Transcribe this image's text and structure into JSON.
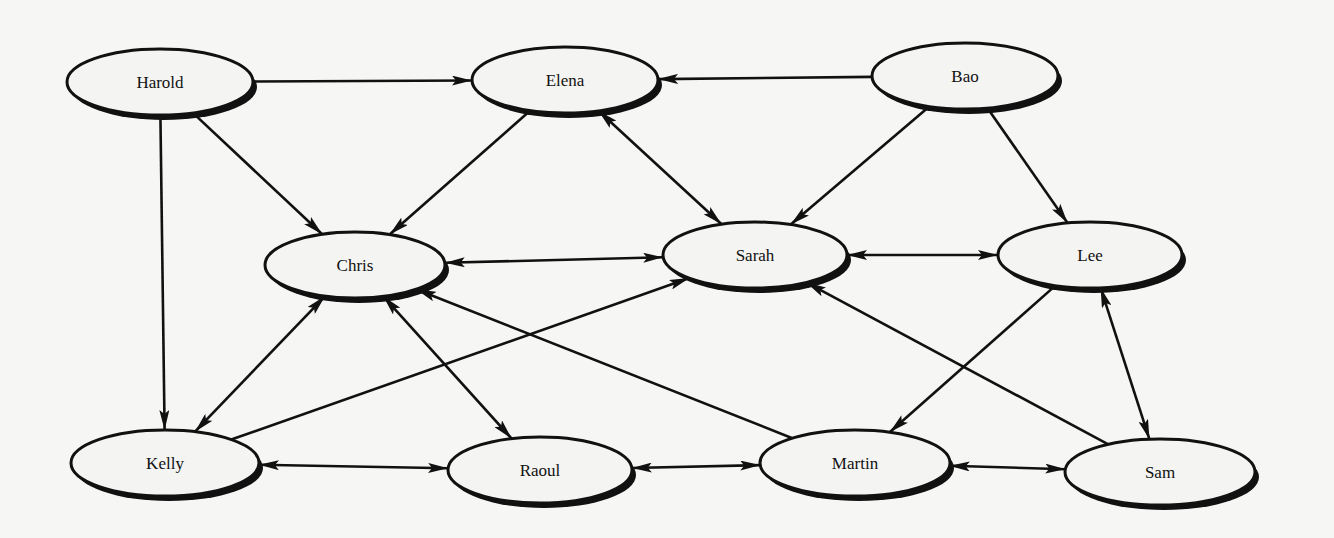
{
  "diagram": {
    "type": "directed-graph",
    "colors": {
      "background": "#f6f6f4",
      "node_fill": "#f4f4f2",
      "stroke": "#111111",
      "shadow": "#111111"
    },
    "nodes": [
      {
        "id": "harold",
        "label": "Harold",
        "cx": 160,
        "cy": 82,
        "rx": 93,
        "ry": 33
      },
      {
        "id": "elena",
        "label": "Elena",
        "cx": 565,
        "cy": 80,
        "rx": 93,
        "ry": 33
      },
      {
        "id": "bao",
        "label": "Bao",
        "cx": 965,
        "cy": 76,
        "rx": 93,
        "ry": 33
      },
      {
        "id": "chris",
        "label": "Chris",
        "cx": 355,
        "cy": 265,
        "rx": 90,
        "ry": 33
      },
      {
        "id": "sarah",
        "label": "Sarah",
        "cx": 755,
        "cy": 255,
        "rx": 92,
        "ry": 33
      },
      {
        "id": "lee",
        "label": "Lee",
        "cx": 1090,
        "cy": 255,
        "rx": 92,
        "ry": 33
      },
      {
        "id": "kelly",
        "label": "Kelly",
        "cx": 165,
        "cy": 463,
        "rx": 94,
        "ry": 33
      },
      {
        "id": "raoul",
        "label": "Raoul",
        "cx": 540,
        "cy": 470,
        "rx": 92,
        "ry": 33
      },
      {
        "id": "martin",
        "label": "Martin",
        "cx": 855,
        "cy": 463,
        "rx": 95,
        "ry": 33
      },
      {
        "id": "sam",
        "label": "Sam",
        "cx": 1160,
        "cy": 472,
        "rx": 95,
        "ry": 33
      }
    ],
    "edges": [
      {
        "from": "harold",
        "to": "elena",
        "bidirectional": false
      },
      {
        "from": "harold",
        "to": "chris",
        "bidirectional": false
      },
      {
        "from": "harold",
        "to": "kelly",
        "bidirectional": false
      },
      {
        "from": "bao",
        "to": "elena",
        "bidirectional": false
      },
      {
        "from": "bao",
        "to": "sarah",
        "bidirectional": false
      },
      {
        "from": "bao",
        "to": "lee",
        "bidirectional": false
      },
      {
        "from": "elena",
        "to": "chris",
        "bidirectional": false
      },
      {
        "from": "elena",
        "to": "sarah",
        "bidirectional": true
      },
      {
        "from": "chris",
        "to": "sarah",
        "bidirectional": true
      },
      {
        "from": "sarah",
        "to": "lee",
        "bidirectional": true
      },
      {
        "from": "chris",
        "to": "kelly",
        "bidirectional": true
      },
      {
        "from": "chris",
        "to": "raoul",
        "bidirectional": true
      },
      {
        "from": "kelly",
        "to": "sarah",
        "bidirectional": false
      },
      {
        "from": "martin",
        "to": "chris",
        "bidirectional": false
      },
      {
        "from": "sam",
        "to": "sarah",
        "bidirectional": false
      },
      {
        "from": "lee",
        "to": "martin",
        "bidirectional": false
      },
      {
        "from": "lee",
        "to": "sam",
        "bidirectional": true
      },
      {
        "from": "kelly",
        "to": "raoul",
        "bidirectional": true
      },
      {
        "from": "raoul",
        "to": "martin",
        "bidirectional": true
      },
      {
        "from": "martin",
        "to": "sam",
        "bidirectional": true
      }
    ]
  }
}
